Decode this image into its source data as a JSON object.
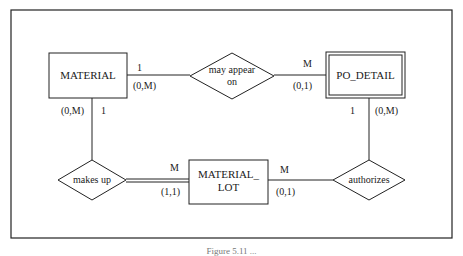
{
  "diagram": {
    "type": "entity-relationship",
    "entities": [
      {
        "id": "material",
        "label": "MATERIAL",
        "weak": false
      },
      {
        "id": "po_detail",
        "label": "PO_DETAIL",
        "weak": true
      },
      {
        "id": "material_lot",
        "label_line1": "MATERIAL_",
        "label_line2": "LOT",
        "weak": false
      }
    ],
    "relationships": [
      {
        "id": "may_appear_on",
        "label_line1": "may appear",
        "label_line2": "on",
        "from": "material",
        "to": "po_detail",
        "material_side": {
          "cardinality": "1",
          "participation": "(0,M)"
        },
        "po_detail_side": {
          "cardinality": "M",
          "participation": "(0,1)"
        }
      },
      {
        "id": "makes_up",
        "label": "makes up",
        "from": "material",
        "to": "material_lot",
        "material_side": {
          "cardinality": "1",
          "participation": "(0,M)"
        },
        "material_lot_side": {
          "cardinality": "M",
          "participation": "(1,1)"
        }
      },
      {
        "id": "authorizes",
        "label": "authorizes",
        "from": "po_detail",
        "to": "material_lot",
        "po_detail_side": {
          "cardinality": "1",
          "participation": "(0,M)"
        },
        "material_lot_side": {
          "cardinality": "M",
          "participation": "(0,1)"
        }
      }
    ],
    "caption": "Figure 5.11 ..."
  }
}
